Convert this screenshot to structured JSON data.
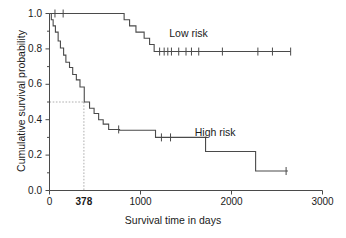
{
  "chart_data": {
    "type": "line",
    "title": "",
    "xlabel": "Survival time in days",
    "ylabel": "Cumulative survival probability",
    "xlim": [
      0,
      3000
    ],
    "ylim": [
      0.0,
      1.0
    ],
    "grid": false,
    "legend_position": "inline-annotation",
    "x_ticks": [
      {
        "value": 0,
        "label": "0"
      },
      {
        "value": 378,
        "label": "378"
      },
      {
        "value": 1000,
        "label": "1000"
      },
      {
        "value": 2000,
        "label": "2000"
      },
      {
        "value": 3000,
        "label": "3000"
      }
    ],
    "y_ticks": [
      {
        "value": 0.0,
        "label": "0.0"
      },
      {
        "value": 0.1,
        "label": ""
      },
      {
        "value": 0.2,
        "label": "0.2"
      },
      {
        "value": 0.3,
        "label": ""
      },
      {
        "value": 0.4,
        "label": "0.4"
      },
      {
        "value": 0.5,
        "label": ""
      },
      {
        "value": 0.6,
        "label": "0.6"
      },
      {
        "value": 0.7,
        "label": ""
      },
      {
        "value": 0.8,
        "label": "0.8"
      },
      {
        "value": 0.9,
        "label": ""
      },
      {
        "value": 1.0,
        "label": "1.0"
      }
    ],
    "annotations": [
      {
        "name": "median-reference",
        "type": "dashed-lines",
        "x": 378,
        "y": 0.5,
        "description": "Dashed lines marking median survival of high risk group at 378 days, survival probability 0.50"
      }
    ],
    "series": [
      {
        "name": "Low risk",
        "label": "Low risk",
        "label_x": 1580,
        "label_y": 0.885,
        "color": "#4a4a4a",
        "steps": [
          [
            0,
            1.0
          ],
          [
            800,
            1.0
          ],
          [
            820,
            0.965
          ],
          [
            860,
            0.965
          ],
          [
            880,
            0.93
          ],
          [
            920,
            0.93
          ],
          [
            950,
            0.895
          ],
          [
            1010,
            0.895
          ],
          [
            1040,
            0.86
          ],
          [
            1080,
            0.86
          ],
          [
            1100,
            0.825
          ],
          [
            1145,
            0.825
          ],
          [
            1150,
            0.785
          ],
          [
            2650,
            0.785
          ]
        ],
        "censor_times": [
          60,
          150,
          1210,
          1260,
          1300,
          1340,
          1420,
          1500,
          1560,
          1640,
          1900,
          2290,
          2450,
          2650
        ],
        "censor_values": [
          1.0,
          1.0,
          0.785,
          0.785,
          0.785,
          0.785,
          0.785,
          0.785,
          0.785,
          0.785,
          0.785,
          0.785,
          0.785,
          0.785
        ]
      },
      {
        "name": "High risk",
        "label": "High risk",
        "label_x": 1860,
        "label_y": 0.325,
        "color": "#4a4a4a",
        "steps": [
          [
            0,
            1.0
          ],
          [
            20,
            0.965
          ],
          [
            35,
            0.965
          ],
          [
            40,
            0.93
          ],
          [
            60,
            0.93
          ],
          [
            65,
            0.895
          ],
          [
            90,
            0.895
          ],
          [
            95,
            0.845
          ],
          [
            115,
            0.845
          ],
          [
            120,
            0.805
          ],
          [
            150,
            0.805
          ],
          [
            155,
            0.765
          ],
          [
            175,
            0.765
          ],
          [
            180,
            0.725
          ],
          [
            215,
            0.725
          ],
          [
            220,
            0.695
          ],
          [
            250,
            0.695
          ],
          [
            255,
            0.655
          ],
          [
            290,
            0.655
          ],
          [
            295,
            0.625
          ],
          [
            330,
            0.625
          ],
          [
            335,
            0.585
          ],
          [
            378,
            0.585
          ],
          [
            382,
            0.5
          ],
          [
            430,
            0.5
          ],
          [
            440,
            0.465
          ],
          [
            480,
            0.465
          ],
          [
            490,
            0.435
          ],
          [
            530,
            0.435
          ],
          [
            540,
            0.4
          ],
          [
            580,
            0.4
          ],
          [
            590,
            0.375
          ],
          [
            640,
            0.375
          ],
          [
            650,
            0.345
          ],
          [
            760,
            0.345
          ],
          [
            770,
            0.34
          ],
          [
            1150,
            0.34
          ],
          [
            1165,
            0.3
          ],
          [
            1700,
            0.3
          ],
          [
            1715,
            0.22
          ],
          [
            2250,
            0.22
          ],
          [
            2265,
            0.11
          ],
          [
            2620,
            0.11
          ]
        ],
        "censor_times": [
          760,
          1230,
          1330,
          2600
        ],
        "censor_values": [
          0.345,
          0.3,
          0.3,
          0.11
        ]
      }
    ]
  },
  "figure": {
    "background_color": "#ffffff",
    "line_color": "#4a4a4a",
    "text_color": "#1a1a1a",
    "dash_color": "#9a9a9a"
  }
}
